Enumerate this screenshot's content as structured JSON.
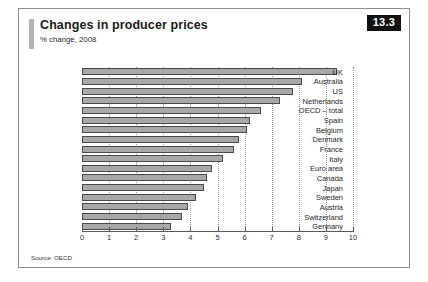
{
  "badge": {
    "number": "13.3"
  },
  "header": {
    "title": "Changes in producer prices",
    "subtitle": "% change, 2008"
  },
  "source": {
    "text": "Source: OECD"
  },
  "chart_data": {
    "type": "bar",
    "orientation": "horizontal",
    "title": "Changes in producer prices",
    "subtitle": "% change, 2008",
    "xlabel": "",
    "ylabel": "",
    "xlim": [
      0,
      10
    ],
    "xticks": [
      0,
      1,
      2,
      3,
      4,
      5,
      6,
      7,
      8,
      9,
      10
    ],
    "grid": true,
    "legend": false,
    "categories": [
      "UK",
      "Australia",
      "US",
      "Netherlands",
      "OECD – total",
      "Spain",
      "Belgium",
      "Denmark",
      "France",
      "Italy",
      "Euro area",
      "Canada",
      "Japan",
      "Sweden",
      "Austria",
      "Switzerland",
      "Germany"
    ],
    "values": [
      9.4,
      8.1,
      7.8,
      7.3,
      6.6,
      6.2,
      6.1,
      5.8,
      5.6,
      5.2,
      4.8,
      4.6,
      4.5,
      4.2,
      3.9,
      3.7,
      3.3
    ]
  }
}
